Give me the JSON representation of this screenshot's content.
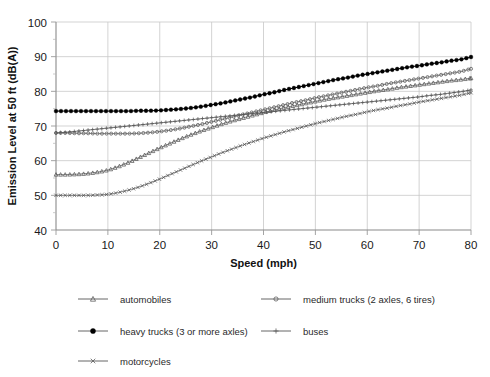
{
  "chart_data": {
    "type": "line",
    "title": "",
    "xlabel": "Speed (mph)",
    "ylabel": "Emission Level at 50 ft (dB(A))",
    "xlim": [
      0,
      80
    ],
    "ylim": [
      40,
      100
    ],
    "xticks": [
      0,
      10,
      20,
      30,
      40,
      50,
      60,
      70,
      80
    ],
    "yticks": [
      40,
      50,
      60,
      70,
      80,
      90,
      100
    ],
    "xtick_labels": [
      "0",
      "10",
      "20",
      "30",
      "40",
      "50",
      "60",
      "70",
      "80"
    ],
    "ytick_labels": [
      "40",
      "50",
      "60",
      "70",
      "80",
      "90",
      "100"
    ],
    "grid": true,
    "minor_ticks_y": [
      45,
      55,
      65,
      75,
      85,
      95
    ],
    "legend_position": "bottom",
    "x": [
      0,
      2,
      4,
      6,
      8,
      10,
      12,
      14,
      16,
      18,
      20,
      22,
      24,
      26,
      28,
      30,
      32,
      34,
      36,
      38,
      40,
      42,
      44,
      46,
      48,
      50,
      52,
      54,
      56,
      58,
      60,
      62,
      64,
      66,
      68,
      70,
      72,
      74,
      76,
      78,
      80
    ],
    "series": [
      {
        "name": "automobiles",
        "marker": "open-triangle",
        "color": "#555555",
        "values": [
          56.0,
          56.0,
          56.1,
          56.3,
          56.7,
          57.3,
          58.3,
          59.5,
          60.9,
          62.3,
          63.7,
          65.0,
          66.3,
          67.5,
          68.6,
          69.6,
          70.6,
          71.5,
          72.3,
          73.1,
          73.9,
          74.6,
          75.3,
          75.9,
          76.5,
          77.1,
          77.7,
          78.2,
          78.7,
          79.2,
          79.7,
          80.2,
          80.6,
          81.1,
          81.5,
          81.9,
          82.3,
          82.7,
          83.1,
          83.4,
          83.8
        ]
      },
      {
        "name": "medium trucks (2 axles, 6 tires)",
        "marker": "open-circle",
        "color": "#555555",
        "values": [
          68.0,
          68.0,
          67.9,
          67.9,
          67.8,
          67.8,
          67.8,
          67.8,
          67.9,
          68.1,
          68.4,
          68.8,
          69.3,
          69.9,
          70.5,
          71.2,
          71.9,
          72.6,
          73.3,
          74.0,
          74.7,
          75.4,
          76.1,
          76.8,
          77.4,
          78.1,
          78.7,
          79.3,
          79.9,
          80.5,
          81.1,
          81.6,
          82.2,
          82.7,
          83.2,
          83.7,
          84.2,
          84.7,
          85.2,
          85.7,
          86.5
        ]
      },
      {
        "name": "heavy trucks (3 or more axles)",
        "marker": "filled-circle",
        "color": "#000000",
        "values": [
          74.3,
          74.3,
          74.3,
          74.3,
          74.3,
          74.3,
          74.3,
          74.3,
          74.4,
          74.4,
          74.5,
          74.7,
          74.9,
          75.2,
          75.6,
          76.1,
          76.6,
          77.2,
          77.8,
          78.4,
          79.1,
          79.7,
          80.4,
          81.0,
          81.6,
          82.2,
          82.8,
          83.4,
          83.9,
          84.5,
          85.0,
          85.5,
          86.0,
          86.5,
          87.0,
          87.4,
          87.9,
          88.3,
          88.8,
          89.2,
          89.9
        ]
      },
      {
        "name": "buses",
        "marker": "plus",
        "color": "#555555",
        "values": [
          68.0,
          68.2,
          68.5,
          68.8,
          69.1,
          69.4,
          69.7,
          70.0,
          70.3,
          70.6,
          70.9,
          71.2,
          71.5,
          71.8,
          72.1,
          72.4,
          72.7,
          73.0,
          73.3,
          73.6,
          73.9,
          74.2,
          74.5,
          74.8,
          75.1,
          75.4,
          75.7,
          76.0,
          76.3,
          76.6,
          76.9,
          77.2,
          77.5,
          77.8,
          78.1,
          78.4,
          78.8,
          79.1,
          79.5,
          79.9,
          80.4
        ]
      },
      {
        "name": "motorcycles",
        "marker": "cross",
        "color": "#555555",
        "values": [
          50.0,
          50.0,
          50.0,
          50.0,
          50.1,
          50.3,
          50.8,
          51.5,
          52.4,
          53.5,
          54.7,
          56.0,
          57.3,
          58.6,
          59.9,
          61.1,
          62.3,
          63.4,
          64.5,
          65.5,
          66.5,
          67.4,
          68.3,
          69.1,
          69.9,
          70.7,
          71.4,
          72.1,
          72.8,
          73.4,
          74.1,
          74.7,
          75.2,
          75.8,
          76.3,
          76.9,
          77.4,
          77.9,
          78.4,
          78.9,
          79.6
        ]
      }
    ]
  },
  "legend": {
    "entries": [
      {
        "label": "automobiles",
        "marker": "open-triangle"
      },
      {
        "label": "medium trucks (2 axles, 6 tires)",
        "marker": "open-circle"
      },
      {
        "label": "heavy trucks (3 or more axles)",
        "marker": "filled-circle"
      },
      {
        "label": "buses",
        "marker": "plus"
      },
      {
        "label": "motorcycles",
        "marker": "cross"
      }
    ]
  }
}
